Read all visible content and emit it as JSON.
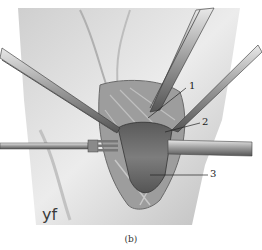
{
  "figure": {
    "caption": "(b)",
    "watermark": "yf",
    "labels": [
      {
        "id": "1",
        "text": "1"
      },
      {
        "id": "2",
        "text": "2"
      },
      {
        "id": "3",
        "text": "3"
      }
    ],
    "colors": {
      "skin": "#d9d9d9",
      "skin_shadow": "#a8a8a8",
      "tissue": "#6f6f6f",
      "instrument": "#8a8a8a",
      "instrument_dark": "#3c3c3c",
      "leader_line": "#222222"
    }
  }
}
